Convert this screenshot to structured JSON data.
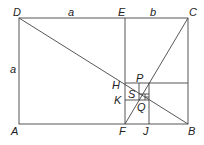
{
  "diagram": {
    "type": "golden-rectangle-construction",
    "points": {
      "A": {
        "label": "A",
        "x": 19,
        "y": 124
      },
      "B": {
        "label": "B",
        "x": 188,
        "y": 124
      },
      "C": {
        "label": "C",
        "x": 188,
        "y": 18
      },
      "D": {
        "label": "D",
        "x": 19,
        "y": 18
      },
      "E": {
        "label": "E",
        "x": 125,
        "y": 18
      },
      "F": {
        "label": "F",
        "x": 125,
        "y": 124
      },
      "H": {
        "label": "H",
        "x": 125,
        "y": 83
      },
      "J": {
        "label": "J",
        "x": 149,
        "y": 124
      },
      "K": {
        "label": "K",
        "x": 125,
        "y": 100
      },
      "P": {
        "label": "P",
        "x": 139,
        "y": 83
      },
      "Q": {
        "label": "Q",
        "x": 141,
        "y": 97
      },
      "S": {
        "label": "S",
        "x": 139,
        "y": 94
      }
    },
    "lengths": {
      "DE": "a",
      "EC": "b",
      "DA": "a"
    },
    "colors": {
      "line": "#444444",
      "text": "#222222",
      "background": "#ffffff"
    }
  }
}
